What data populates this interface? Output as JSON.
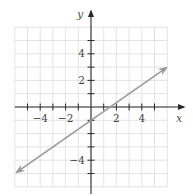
{
  "chart_data": {
    "type": "line",
    "title": "",
    "xlabel": "x",
    "ylabel": "y",
    "xlim": [
      -6,
      6
    ],
    "ylim": [
      -6,
      6
    ],
    "grid": true,
    "x_tick_labels": [
      "-4",
      "-2",
      "2",
      "4"
    ],
    "y_tick_labels": [
      "4",
      "2",
      "-4"
    ],
    "x_tick_values": [
      -4,
      -2,
      2,
      4
    ],
    "y_tick_values": [
      4,
      2,
      -4
    ],
    "series": [
      {
        "name": "line",
        "equation": "y = (2/3)x - 1",
        "slope": 0.6667,
        "intercept": -1,
        "x": [
          -6,
          6
        ],
        "y": [
          -5,
          3
        ],
        "arrows": "both",
        "color": "#9a9a9a"
      }
    ],
    "legend": null
  },
  "labels": {
    "x_axis": "x",
    "y_axis": "y",
    "x_ticks": {
      "neg4": "−4",
      "neg2": "−2",
      "pos2": "2",
      "pos4": "4"
    },
    "y_ticks": {
      "pos4": "4",
      "pos2": "2",
      "neg4": "−4"
    }
  },
  "colors": {
    "grid": "#dcdcdc",
    "axis": "#2a2a2a",
    "line": "#9a9a9a"
  }
}
